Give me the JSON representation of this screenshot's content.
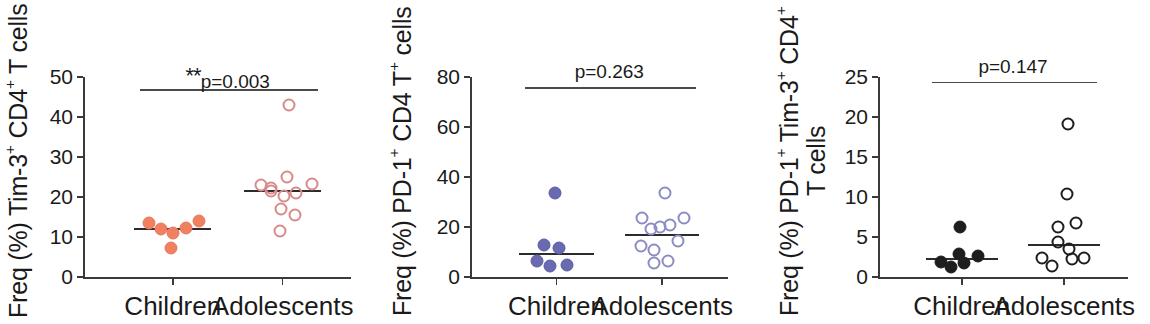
{
  "figure": {
    "panel_count": 3,
    "x_categories": [
      "Children",
      "Adolescents"
    ]
  },
  "chart_data": [
    {
      "type": "scatter",
      "panel_id": "panel-1",
      "title": "",
      "ylabel": "Freq (%) Tim-3+ CD4+ T cells",
      "ylabel_parts": [
        "Freq (%) Tim-3",
        "+",
        " CD4",
        "+",
        " T cells"
      ],
      "xlabel": "",
      "ylim": [
        0,
        50
      ],
      "yticks": [
        0,
        10,
        20,
        30,
        40,
        50
      ],
      "ytick_labels": [
        "0",
        "10",
        "20",
        "30",
        "40",
        "50"
      ],
      "grid": false,
      "legend": "none",
      "annotation": "**p=0.003",
      "annotation_stars": "**",
      "annotation_text": "p=0.003",
      "sigbar_y": 47,
      "categories": [
        "Children",
        "Adolescents"
      ],
      "series": [
        {
          "name": "Children",
          "marker": "filled-circle",
          "color": "#E8795E",
          "fill": "#F08060",
          "median": 12.0,
          "n": 6,
          "values": [
            13.5,
            12.0,
            11.0,
            12.2,
            14.0,
            7.3
          ],
          "jitter": [
            -0.3,
            -0.15,
            0.0,
            0.16,
            0.33,
            -0.02
          ]
        },
        {
          "name": "Adolescents",
          "marker": "open-circle",
          "color": "#D88A8A",
          "fill": "none",
          "median": 21.5,
          "n": 11,
          "values": [
            43.0,
            25.0,
            23.0,
            22.3,
            21.6,
            20.3,
            21.0,
            23.3,
            17.0,
            15.5,
            11.4
          ],
          "jitter": [
            0.08,
            0.05,
            -0.27,
            -0.14,
            -0.15,
            0.02,
            0.17,
            0.36,
            -0.02,
            0.16,
            -0.03
          ]
        }
      ]
    },
    {
      "type": "scatter",
      "panel_id": "panel-2",
      "title": "",
      "ylabel": "Freq (%) PD-1+ CD4 T+ cells",
      "ylabel_parts": [
        "Freq (%) PD-1",
        "+",
        " CD4 T",
        "+",
        " cells"
      ],
      "xlabel": "",
      "ylim": [
        0,
        80
      ],
      "yticks": [
        0,
        20,
        40,
        60,
        80
      ],
      "ytick_labels": [
        "0",
        "20",
        "40",
        "60",
        "80"
      ],
      "grid": false,
      "legend": "none",
      "annotation": "p=0.263",
      "annotation_stars": "",
      "annotation_text": "p=0.263",
      "sigbar_y": 76,
      "categories": [
        "Children",
        "Adolescents"
      ],
      "series": [
        {
          "name": "Children",
          "marker": "filled-circle",
          "color": "#5B5BA5",
          "fill": "#6A6AB0",
          "median": 9.3,
          "n": 6,
          "values": [
            33.8,
            13.0,
            11.8,
            6.6,
            4.5,
            4.9
          ],
          "jitter": [
            -0.02,
            -0.16,
            0.03,
            -0.25,
            -0.08,
            0.14
          ]
        },
        {
          "name": "Adolescents",
          "marker": "open-circle",
          "color": "#8C8CC4",
          "fill": "none",
          "median": 17.0,
          "n": 11,
          "values": [
            33.6,
            23.5,
            20.2,
            21.0,
            23.8,
            19.4,
            12.6,
            11.0,
            14.4,
            6.4,
            5.6
          ],
          "jitter": [
            0.03,
            -0.26,
            -0.03,
            0.1,
            0.28,
            -0.14,
            -0.28,
            -0.1,
            0.2,
            0.07,
            -0.1
          ]
        }
      ]
    },
    {
      "type": "scatter",
      "panel_id": "panel-3",
      "title": "",
      "ylabel": "Freq (%) PD-1+ Tim-3+ CD4+ T cells",
      "ylabel_parts": [
        "Freq (%) PD-1",
        "+",
        " Tim-3",
        "+",
        " CD4",
        "+",
        " T cells"
      ],
      "xlabel": "",
      "ylim": [
        0,
        25
      ],
      "yticks": [
        0,
        5,
        10,
        15,
        20,
        25
      ],
      "ytick_labels": [
        "0",
        "5",
        "10",
        "15",
        "20",
        "25"
      ],
      "grid": false,
      "legend": "none",
      "annotation": "p=0.147",
      "annotation_stars": "",
      "annotation_text": "p=0.147",
      "sigbar_y": 24.4,
      "categories": [
        "Children",
        "Adolescents"
      ],
      "series": [
        {
          "name": "Children",
          "marker": "filled-circle",
          "color": "#1E1E1E",
          "fill": "#1E1E1E",
          "median": 2.2,
          "n": 6,
          "values": [
            6.2,
            2.9,
            1.9,
            1.8,
            1.2,
            2.6
          ],
          "jitter": [
            -0.02,
            -0.04,
            -0.28,
            0.03,
            -0.14,
            0.22
          ]
        },
        {
          "name": "Adolescents",
          "marker": "open-circle",
          "color": "#1E1E1E",
          "fill": "none",
          "median": 4.0,
          "n": 10,
          "values": [
            19.1,
            10.4,
            6.7,
            6.2,
            4.4,
            3.5,
            2.4,
            2.2,
            2.4,
            1.4
          ],
          "jitter": [
            0.05,
            0.04,
            0.16,
            -0.08,
            -0.08,
            0.07,
            -0.3,
            0.1,
            0.26,
            -0.17
          ]
        }
      ]
    }
  ]
}
